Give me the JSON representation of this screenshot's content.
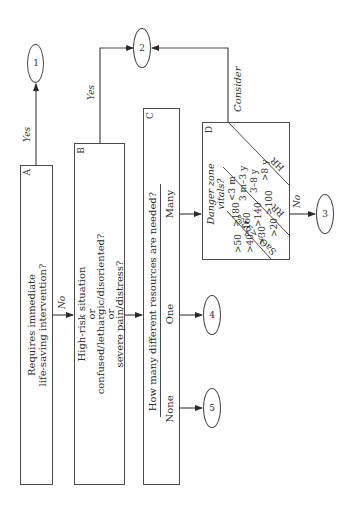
{
  "diagram": {
    "orientation": "rotated -90deg (reads bottom-to-top)",
    "boxes": {
      "A": {
        "letter": "A",
        "line1": "Requires immediate",
        "line2": "life-saving intervention?"
      },
      "B": {
        "letter": "B",
        "line1": "High-risk situation",
        "line2": "or",
        "line3": "confused/lethargic/disoriented?",
        "line4": "or",
        "line5": "severe pain/distress?"
      },
      "C": {
        "letter": "C",
        "question": "How many different resources are needed?",
        "options": [
          "None",
          "One",
          "Many"
        ]
      },
      "D": {
        "letter": "D",
        "title_line1": "Danger zone",
        "title_line2": "vitals?",
        "ages": [
          "<3 m",
          "3 m–3 y",
          "3–8 y",
          ">8 y"
        ],
        "hr_values": [
          ">180",
          ">160",
          ">140",
          ">100"
        ],
        "rr_values": [
          ">50",
          ">40",
          ">30",
          ">20"
        ],
        "col_hr": "HR",
        "col_rr": "RR",
        "col_sao2": "SaO₂ <92%"
      }
    },
    "outcomes": [
      "1",
      "2",
      "3",
      "4",
      "5"
    ],
    "edge_labels": {
      "a_yes": "Yes",
      "a_no": "No",
      "b_yes": "Yes",
      "d_consider": "Consider",
      "d_no": "No"
    },
    "colors": {
      "line": "#4a4a4a",
      "text": "#2a2a2a",
      "background": "#ffffff"
    }
  }
}
